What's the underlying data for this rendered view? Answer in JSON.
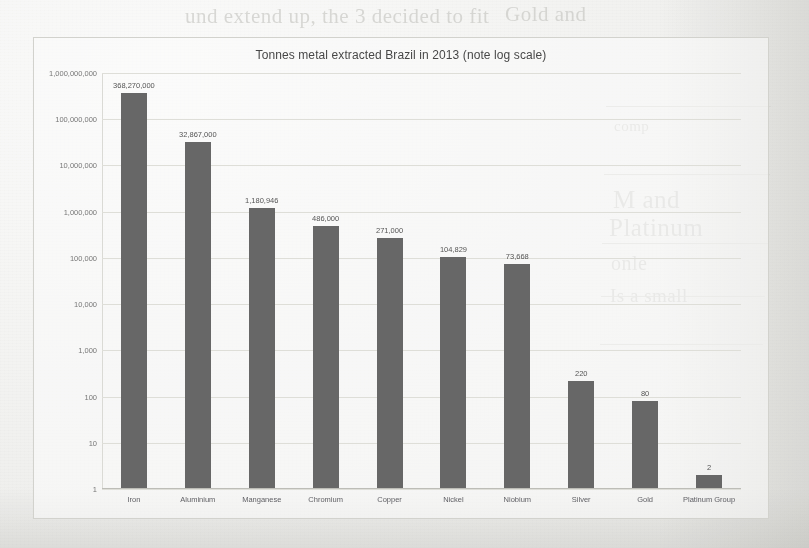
{
  "background": {
    "bleed_through_lines": [
      "und extend up, the 3 decided to fit",
      "Gold and",
      "comp",
      "M and",
      "Platinum",
      "onle",
      "Is a small"
    ]
  },
  "chart_data": {
    "type": "bar",
    "title": "Tonnes metal extracted Brazil in 2013 (note log scale)",
    "xlabel": "",
    "ylabel": "",
    "scale": "log",
    "grid": true,
    "legend": "none",
    "categories": [
      "Iron",
      "Aluminium",
      "Manganese",
      "Chromium",
      "Copper",
      "Nickel",
      "Niobium",
      "Silver",
      "Gold",
      "Platinum Group"
    ],
    "values": [
      368270000,
      32867000,
      1180946,
      486000,
      271000,
      104829,
      73668,
      220,
      80,
      2
    ],
    "value_labels": [
      "368,270,000",
      "32,867,000",
      "1,180,946",
      "486,000",
      "271,000",
      "104,829",
      "73,668",
      "220",
      "80",
      "2"
    ],
    "ytick_labels": [
      "1,000,000,000",
      "100,000,000",
      "10,000,000",
      "1,000,000",
      "100,000",
      "10,000",
      "1,000",
      "100",
      "10",
      "1"
    ],
    "ytick_values": [
      1000000000,
      100000000,
      10000000,
      1000000,
      100000,
      10000,
      1000,
      100,
      10,
      1
    ],
    "ylim": [
      1,
      1000000000
    ],
    "bar_color": "#5e5e5e",
    "grid_color": "#dcdcd6",
    "plot_background": "#fbfbfa"
  }
}
